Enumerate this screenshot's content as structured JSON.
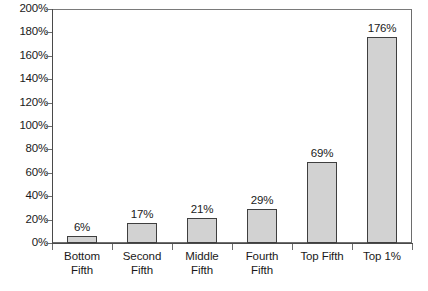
{
  "chart_data": {
    "type": "bar",
    "title": "",
    "xlabel": "",
    "ylabel": "",
    "categories": [
      "Bottom Fifth",
      "Second Fifth",
      "Middle Fifth",
      "Fourth Fifth",
      "Top Fifth",
      "Top 1%"
    ],
    "category_lines": [
      [
        "Bottom",
        "Fifth"
      ],
      [
        "Second",
        "Fifth"
      ],
      [
        "Middle",
        "Fifth"
      ],
      [
        "Fourth",
        "Fifth"
      ],
      [
        "Top Fifth"
      ],
      [
        "Top 1%"
      ]
    ],
    "values": [
      6,
      17,
      21,
      29,
      69,
      176
    ],
    "value_labels": [
      "6%",
      "17%",
      "21%",
      "29%",
      "69%",
      "176%"
    ],
    "ylim": [
      0,
      200
    ],
    "ytick_values": [
      200,
      180,
      160,
      140,
      120,
      100,
      80,
      60,
      40,
      20,
      0
    ],
    "ytick_labels": [
      "200%",
      "180%",
      "160%",
      "140%",
      "120%",
      "100%",
      "80%",
      "60%",
      "40%",
      "20%",
      "0%"
    ],
    "grid": false,
    "legend": "none",
    "bar_fill_color": "#d2d2d2",
    "bar_border_color": "#3f3f3f",
    "axis_color": "#4a4a4a",
    "plot_background": "#ffffff"
  }
}
